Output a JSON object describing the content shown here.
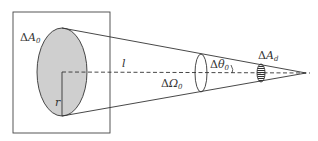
{
  "diagram": {
    "type": "solid-angle-geometry",
    "labels": {
      "source_area": {
        "delta": "Δ",
        "symbol": "A",
        "sub": "0"
      },
      "distance": {
        "symbol": "l"
      },
      "radius": {
        "symbol": "r"
      },
      "solid_angle": {
        "delta": "Δ",
        "symbol": "Ω",
        "sub": "0"
      },
      "half_angle": {
        "delta": "Δ",
        "symbol": "θ",
        "sub": "0"
      },
      "detector_area": {
        "delta": "Δ",
        "symbol": "A",
        "sub": "d"
      }
    },
    "colors": {
      "stroke": "#333333",
      "source_fill": "#cfcfcf",
      "background": "#ffffff"
    }
  }
}
